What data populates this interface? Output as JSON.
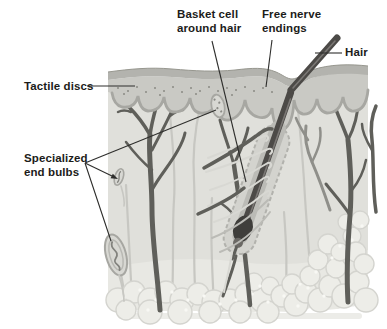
{
  "figure": {
    "type": "anatomy-diagram"
  },
  "labels": {
    "tactile_discs": "Tactile discs",
    "specialized_end_bulbs": "Specialized\nend bulbs",
    "basket_cell": "Basket cell\naround hair",
    "free_nerve_endings": "Free nerve\nendings",
    "hair": "Hair"
  },
  "colors": {
    "page-bg": "#ffffff",
    "ink": "#1c1c1a",
    "leader": "#2e2e2c",
    "surface-band": "#b3b3ae",
    "surface-outline": "#97978f",
    "epidermis": "#c9c9c4",
    "epidermis-edge": "#a7a7a2",
    "dermis": "#e0e0db",
    "subcutis": "#e8e8e3",
    "fat-bubble": "#edede8",
    "fat-outline": "#d4d4cf",
    "fat-dot": "#f8f8f4",
    "nerve-dark": "#5f5f5a",
    "nerve-mid": "#8f8f8a",
    "fiber-light": "#c7c7c2",
    "basket-fiber": "#d8d8d3",
    "hair": "#4c4a47",
    "follicle-outer": "#d3d3ce",
    "follicle-edge": "#b2b2ad",
    "follicle-inner": "#bbbbb6",
    "bulb": "#3f3e3b",
    "end-bulb": "#d8d8d3",
    "tactile-dot": "#8a8a85"
  }
}
